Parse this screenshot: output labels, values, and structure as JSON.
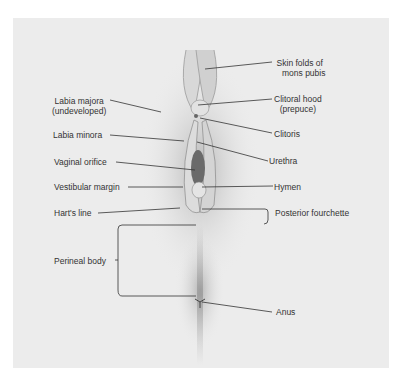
{
  "diagram": {
    "type": "anatomical-illustration",
    "labels_left": [
      {
        "id": "labia-majora",
        "line1": "Labia majora",
        "line2": "(undeveloped)"
      },
      {
        "id": "labia-minora",
        "line1": "Labia minora"
      },
      {
        "id": "vaginal-orifice",
        "line1": "Vaginal orifice"
      },
      {
        "id": "vestibular-margin",
        "line1": "Vestibular margin"
      },
      {
        "id": "harts-line",
        "line1": "Hart's line"
      },
      {
        "id": "perineal-body",
        "line1": "Perineal body"
      }
    ],
    "labels_right": [
      {
        "id": "skin-folds",
        "line1": "Skin folds of",
        "line2": "mons pubis"
      },
      {
        "id": "clitoral-hood",
        "line1": "Clitoral hood",
        "line2": "(prepuce)"
      },
      {
        "id": "clitoris",
        "line1": "Clitoris"
      },
      {
        "id": "urethra",
        "line1": "Urethra"
      },
      {
        "id": "hymen",
        "line1": "Hymen"
      },
      {
        "id": "posterior-fourchette",
        "line1": "Posterior fourchette"
      },
      {
        "id": "anus",
        "line1": "Anus"
      }
    ]
  }
}
